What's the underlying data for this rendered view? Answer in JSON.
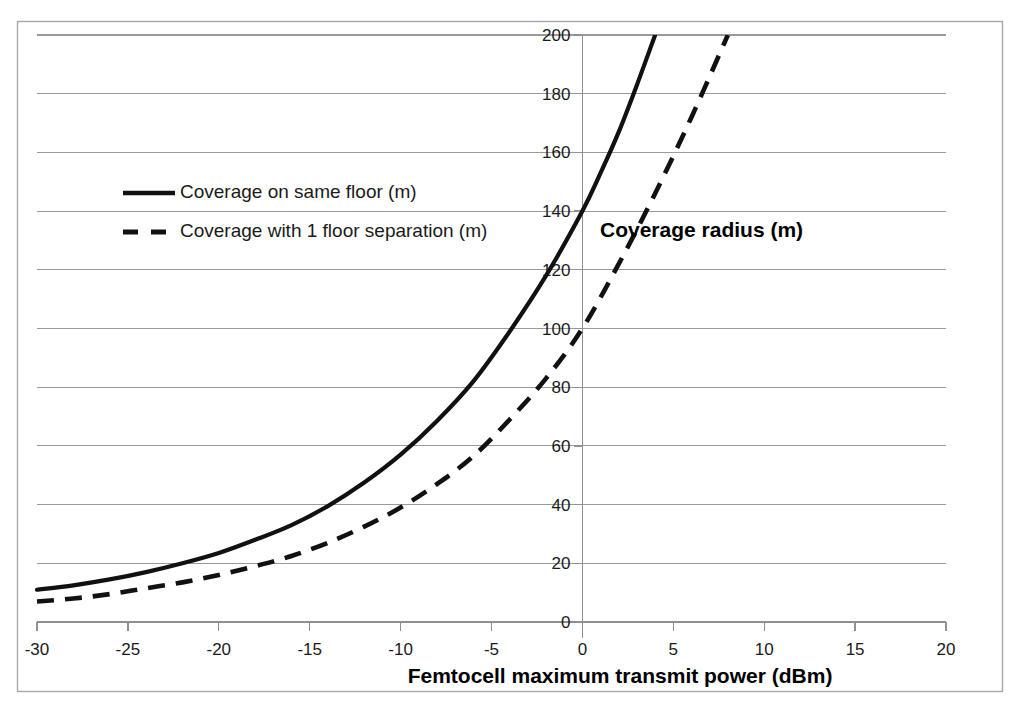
{
  "chart_data": {
    "type": "line",
    "title": "",
    "xlabel": "Femtocell maximum transmit power (dBm)",
    "ylabel": "Coverage radius (m)",
    "xlim": [
      -30,
      20
    ],
    "ylim": [
      0,
      200
    ],
    "xticks": [
      -30,
      -25,
      -20,
      -15,
      -10,
      -5,
      0,
      5,
      10,
      15,
      20
    ],
    "xtick_labels": [
      "-30",
      "-25",
      "-20",
      "-15",
      "-10",
      "-5",
      "0",
      "5",
      "10",
      "15",
      "20"
    ],
    "yticks": [
      0,
      20,
      40,
      60,
      80,
      100,
      120,
      140,
      160,
      180,
      200
    ],
    "ytick_labels": [
      "0",
      "20",
      "40",
      "60",
      "80",
      "100",
      "120",
      "140",
      "160",
      "180",
      "200"
    ],
    "grid": "horizontal",
    "legend_position": "inside-upper-left",
    "y_axis_position_at_x": 0,
    "series": [
      {
        "name": "Coverage on same floor (m)",
        "style": "solid",
        "color": "#111111",
        "x": [
          -30,
          -28,
          -26,
          -24,
          -22,
          -20,
          -18,
          -16,
          -14,
          -12,
          -10,
          -8,
          -6,
          -4,
          -2,
          0,
          1,
          2,
          3,
          4
        ],
        "values": [
          11,
          12.5,
          14.5,
          17,
          20,
          23.5,
          28,
          33,
          39.5,
          47.5,
          57,
          68.5,
          82,
          99,
          118,
          140,
          153,
          167,
          183,
          200
        ]
      },
      {
        "name": "Coverage with 1 floor separation (m)",
        "style": "dashed",
        "color": "#111111",
        "x": [
          -30,
          -28,
          -26,
          -24,
          -22,
          -20,
          -18,
          -16,
          -14,
          -12,
          -10,
          -8,
          -6,
          -4,
          -2,
          0,
          2,
          4,
          6,
          8
        ],
        "values": [
          7,
          8,
          9.5,
          11.5,
          13.5,
          16,
          19,
          22.5,
          27,
          32.5,
          39,
          47,
          56.5,
          69,
          83,
          100,
          122,
          146,
          172,
          200
        ]
      }
    ],
    "annotations": [
      {
        "text": "Coverage radius (m)",
        "x": 0.7,
        "y": 135,
        "role": "y-axis-title-inside-plot"
      }
    ]
  },
  "legend": {
    "items": [
      {
        "label": "Coverage on same floor (m)",
        "style": "solid"
      },
      {
        "label": "Coverage with 1 floor separation (m)",
        "style": "dashed"
      }
    ]
  },
  "colors": {
    "series": "#111111",
    "gridline": "#9a9a9a",
    "frame": "#a8a8a8",
    "background": "#ffffff",
    "text": "#1a1a1a"
  }
}
